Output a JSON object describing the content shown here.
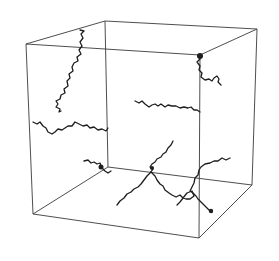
{
  "figure": {
    "background": "#ffffff",
    "edge_color": "#3a3a3a",
    "chain_color": "#1e1e1e",
    "cube": {
      "front_top_left": [
        26,
        44
      ],
      "front_top_right": [
        200,
        55
      ],
      "front_bottom_left": [
        33,
        214
      ],
      "front_bottom_right": [
        199,
        238
      ],
      "back_top_left": [
        105,
        21
      ],
      "back_top_right": [
        257,
        29
      ],
      "back_bottom_left": [
        108,
        167
      ],
      "back_bottom_right": [
        252,
        185
      ]
    },
    "chains": [
      {
        "name": "upper-left-vertical-chain",
        "points": [
          [
            80,
            30
          ],
          [
            84,
            31
          ],
          [
            81,
            34
          ],
          [
            83,
            38
          ],
          [
            80,
            42
          ],
          [
            82,
            46
          ],
          [
            79,
            50
          ],
          [
            81,
            54
          ],
          [
            77,
            57
          ],
          [
            78,
            61
          ],
          [
            74,
            63
          ],
          [
            72,
            67
          ],
          [
            73,
            71
          ],
          [
            69,
            74
          ],
          [
            70,
            78
          ],
          [
            67,
            81
          ],
          [
            68,
            86
          ],
          [
            64,
            89
          ],
          [
            65,
            93
          ],
          [
            61,
            95
          ],
          [
            60,
            99
          ],
          [
            56,
            101
          ],
          [
            58,
            104
          ],
          [
            56,
            107
          ],
          [
            60,
            109
          ],
          [
            59,
            112
          ],
          [
            61,
            111
          ]
        ]
      },
      {
        "name": "left-horizontal-chain",
        "points": [
          [
            33,
            122
          ],
          [
            37,
            124
          ],
          [
            40,
            122
          ],
          [
            43,
            126
          ],
          [
            46,
            128
          ],
          [
            48,
            132
          ],
          [
            52,
            134
          ],
          [
            55,
            132
          ],
          [
            58,
            129
          ],
          [
            62,
            130
          ],
          [
            65,
            128
          ],
          [
            68,
            126
          ],
          [
            72,
            126
          ],
          [
            75,
            122
          ],
          [
            79,
            124
          ],
          [
            83,
            126
          ],
          [
            87,
            125
          ],
          [
            90,
            128
          ],
          [
            94,
            127
          ],
          [
            98,
            130
          ],
          [
            102,
            129
          ],
          [
            106,
            131
          ],
          [
            108,
            128
          ]
        ]
      },
      {
        "name": "corner-chain",
        "points": [
          [
            198,
            55
          ],
          [
            200,
            59
          ],
          [
            197,
            62
          ],
          [
            200,
            66
          ],
          [
            199,
            70
          ],
          [
            202,
            73
          ],
          [
            201,
            77
          ],
          [
            205,
            80
          ],
          [
            209,
            79
          ],
          [
            212,
            81
          ],
          [
            214,
            78
          ],
          [
            217,
            76
          ],
          [
            219,
            79
          ],
          [
            218,
            82
          ],
          [
            221,
            85
          ]
        ]
      },
      {
        "name": "middle-horizontal-chain",
        "points": [
          [
            135,
            101
          ],
          [
            139,
            103
          ],
          [
            142,
            101
          ],
          [
            145,
            104
          ],
          [
            149,
            107
          ],
          [
            152,
            105
          ],
          [
            155,
            104
          ],
          [
            158,
            106
          ],
          [
            161,
            104
          ],
          [
            165,
            107
          ],
          [
            168,
            105
          ],
          [
            172,
            106
          ],
          [
            176,
            106
          ],
          [
            180,
            108
          ],
          [
            184,
            107
          ],
          [
            188,
            108
          ],
          [
            191,
            107
          ],
          [
            194,
            110
          ],
          [
            197,
            110
          ],
          [
            200,
            112
          ]
        ]
      },
      {
        "name": "bottom-left-knot-chain",
        "points": [
          [
            84,
            161
          ],
          [
            88,
            160
          ],
          [
            91,
            163
          ],
          [
            94,
            162
          ],
          [
            97,
            164
          ],
          [
            100,
            163
          ],
          [
            101,
            166
          ],
          [
            103,
            169
          ],
          [
            105,
            171
          ],
          [
            108,
            173
          ],
          [
            111,
            171
          ]
        ]
      },
      {
        "name": "central-branched-chain-upper",
        "points": [
          [
            173,
            141
          ],
          [
            171,
            145
          ],
          [
            168,
            148
          ],
          [
            166,
            152
          ],
          [
            163,
            154
          ],
          [
            161,
            157
          ],
          [
            157,
            159
          ],
          [
            155,
            162
          ],
          [
            152,
            164
          ],
          [
            150,
            167
          ],
          [
            153,
            169
          ],
          [
            151,
            172
          ]
        ]
      },
      {
        "name": "central-branched-chain-left",
        "points": [
          [
            151,
            172
          ],
          [
            147,
            176
          ],
          [
            144,
            180
          ],
          [
            141,
            184
          ],
          [
            138,
            187
          ],
          [
            134,
            189
          ],
          [
            131,
            192
          ],
          [
            127,
            194
          ],
          [
            124,
            198
          ],
          [
            120,
            201
          ],
          [
            117,
            205
          ]
        ]
      },
      {
        "name": "central-branched-chain-right",
        "points": [
          [
            151,
            172
          ],
          [
            155,
            176
          ],
          [
            157,
            180
          ],
          [
            160,
            184
          ],
          [
            163,
            186
          ],
          [
            165,
            190
          ],
          [
            169,
            193
          ],
          [
            172,
            195
          ],
          [
            176,
            197
          ],
          [
            180,
            195
          ],
          [
            183,
            198
          ],
          [
            180,
            202
          ],
          [
            177,
            205
          ]
        ]
      },
      {
        "name": "right-branch-chain",
        "points": [
          [
            230,
            158
          ],
          [
            226,
            160
          ],
          [
            222,
            158
          ],
          [
            218,
            161
          ],
          [
            214,
            161
          ],
          [
            210,
            163
          ],
          [
            205,
            164
          ],
          [
            201,
            167
          ],
          [
            199,
            170
          ],
          [
            198,
            175
          ],
          [
            195,
            178
          ],
          [
            194,
            183
          ],
          [
            192,
            187
          ],
          [
            190,
            191
          ],
          [
            193,
            193
          ],
          [
            196,
            196
          ],
          [
            198,
            199
          ],
          [
            201,
            202
          ],
          [
            204,
            205
          ],
          [
            207,
            208
          ],
          [
            210,
            211
          ],
          [
            212,
            212
          ]
        ]
      },
      {
        "name": "loop-chain",
        "points": [
          [
            183,
            198
          ],
          [
            187,
            193
          ],
          [
            192,
            191
          ],
          [
            194,
            196
          ],
          [
            190,
            199
          ],
          [
            186,
            199
          ],
          [
            183,
            198
          ]
        ]
      }
    ],
    "knots": [
      {
        "name": "corner-knot",
        "center": [
          200,
          56
        ],
        "r": 3
      },
      {
        "name": "left-knot",
        "center": [
          101,
          167
        ],
        "r": 2.5
      },
      {
        "name": "right-end-knot",
        "center": [
          211,
          211
        ],
        "r": 2.2
      },
      {
        "name": "junction-knot",
        "center": [
          152,
          168
        ],
        "r": 2
      }
    ]
  }
}
